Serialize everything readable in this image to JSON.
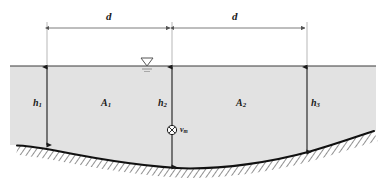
{
  "figure": {
    "colors": {
      "water_fill": "#e2e2e2",
      "line": "#1a1a1a",
      "dimension_line": "#6e6e6e",
      "hatch": "#4a4a4a",
      "background": "#ffffff"
    }
  },
  "dimensions": [
    {
      "id": "d-left",
      "label": "d",
      "from_x": 47,
      "to_x": 172,
      "y": 28
    },
    {
      "id": "d-right",
      "label": "d",
      "from_x": 172,
      "to_x": 307,
      "y": 28
    }
  ],
  "depths": [
    {
      "id": "h1",
      "symbol": "h",
      "subscript": "1",
      "x": 47,
      "top_y": 66,
      "bottom_y": 146
    },
    {
      "id": "h2",
      "symbol": "h",
      "subscript": "2",
      "x": 172,
      "top_y": 66,
      "bottom_y": 168
    },
    {
      "id": "h3",
      "symbol": "h",
      "subscript": "3",
      "x": 307,
      "top_y": 66,
      "bottom_y": 140
    }
  ],
  "areas": [
    {
      "id": "A1",
      "symbol": "A",
      "subscript": "1",
      "x": 105,
      "y": 103
    },
    {
      "id": "A2",
      "symbol": "A",
      "subscript": "2",
      "x": 240,
      "y": 103
    }
  ],
  "velocity": {
    "id": "vm",
    "symbol": "v",
    "subscript": "m",
    "marker": "circled-cross",
    "x": 172,
    "y": 130
  },
  "water_surface": {
    "label": "water-surface-line",
    "y": 66,
    "from_x": 10,
    "to_x": 376,
    "symbol": "water-table-triangle",
    "symbol_x": 147
  },
  "bed": {
    "label": "channel-bed-profile",
    "hatch_pattern": "diagonal-cross-hatch",
    "points": "18,146 60,153 100,161 140,166 190,168 240,166 285,159 325,148 352,140 372,132"
  }
}
